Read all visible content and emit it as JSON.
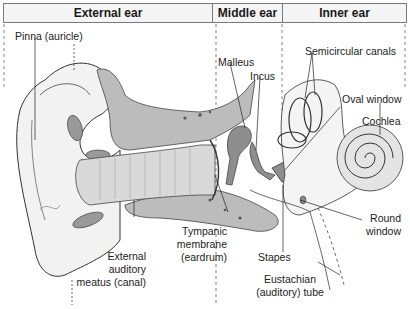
{
  "sections": [
    {
      "label": "External ear"
    },
    {
      "label": "Middle ear"
    },
    {
      "label": "Inner ear"
    }
  ],
  "labels": {
    "pinna": "Pinna (auricle)",
    "malleus": "Malleus",
    "incus": "Incus",
    "semicircular": "Semicircular canals",
    "oval_window": "Oval window",
    "cochlea": "Cochlea",
    "round_window_1": "Round",
    "round_window_2": "window",
    "stapes": "Stapes",
    "eustachian_1": "Eustachian",
    "eustachian_2": "(auditory) tube",
    "tympanic_1": "Tympanic",
    "tympanic_2": "membrane",
    "tympanic_3": "(eardrum)",
    "eam_1": "External",
    "eam_2": "auditory",
    "eam_3": "meatus (canal)"
  },
  "colors": {
    "bone": "#b9b9b9",
    "ossicle": "#8e8e8e",
    "skin": "#efefef",
    "outline": "#333333",
    "divider": "#555555"
  }
}
